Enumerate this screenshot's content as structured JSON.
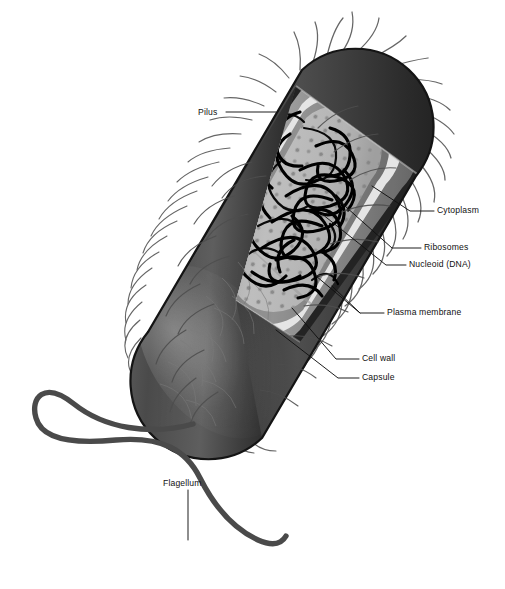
{
  "figure": {
    "organism_shape": "rod-shaped bacillus bacterium, shown at an oblique angle with a cutaway quarter removed to expose the interior",
    "background_color": "#ffffff",
    "ink_color": "#111111",
    "style": "grayscale airbrushed biology textbook illustration with thin black leader lines to text labels"
  },
  "labels": [
    {
      "id": "pilus",
      "text": "Pilus",
      "side": "left",
      "x": 198,
      "y": 108,
      "leader": "horizontal line running right from the text to the base of the hair-like pili on the upper-left flank of the cell"
    },
    {
      "id": "cytoplasm",
      "text": "Cytoplasm",
      "side": "right",
      "x": 437,
      "y": 211,
      "leader": "short elbow leader angling down-left into the pale gray granular interior of the cell"
    },
    {
      "id": "ribosomes",
      "text": "Ribosomes",
      "side": "right",
      "x": 424,
      "y": 248,
      "leader": "long thin line angling up-left to the small dark speckles suspended in the cytoplasm"
    },
    {
      "id": "nucleoid",
      "text": "Nucleoid (DNA)",
      "side": "right",
      "x": 409,
      "y": 265,
      "leader": "long thin line angling up-left to the dense tangle of black looping DNA strands"
    },
    {
      "id": "plasma-membrane",
      "text": "Plasma membrane",
      "side": "right",
      "x": 387,
      "y": 313,
      "leader": "two converging lines running up-left to the thin bright white band just inside the cell wall"
    },
    {
      "id": "cell-wall",
      "text": "Cell wall",
      "side": "right",
      "x": 362,
      "y": 359,
      "leader": "line running up-left to the medium gray layer between the capsule and the plasma membrane"
    },
    {
      "id": "capsule",
      "text": "Capsule",
      "side": "right",
      "x": 362,
      "y": 378,
      "leader": "line running up-left to the dark outermost sheath enclosing the whole cell"
    },
    {
      "id": "flagellum",
      "text": "Flagellum",
      "side": "below",
      "x": 163,
      "y": 484,
      "leader": "short vertical line dropping from the text down to the long wavy tail"
    }
  ],
  "structures": [
    {
      "name": "capsule",
      "description": "dark charcoal outermost sheath forming the silhouette of the rod",
      "color": "#2e2e2e"
    },
    {
      "name": "cell-wall",
      "description": "medium gray band immediately inside the capsule, visible as a ring at the cut face",
      "color": "#9a9a9a"
    },
    {
      "name": "plasma-membrane",
      "description": "thin bright white line lining the inside of the cell wall",
      "color": "#f2f2f2"
    },
    {
      "name": "cytoplasm",
      "description": "pale gray granular matrix filling the exposed interior",
      "color": "#c4c4c4"
    },
    {
      "name": "ribosomes",
      "description": "scattered small darker gray dots peppered through the cytoplasm",
      "color": "#8d8d8d"
    },
    {
      "name": "nucleoid",
      "description": "tangled mass of thick black looping DNA filaments occupying the centre of the cytoplasm",
      "color": "#000000"
    },
    {
      "name": "pili",
      "description": "many fine curved hair-like filaments radiating outward all around the cell surface",
      "color": "#5a5a5a"
    },
    {
      "name": "flagellum",
      "description": "single long thick wavy tail emerging from the rounded lower-left pole, sweeping left then curving back right in a broad S",
      "color": "#4a4a4a"
    }
  ]
}
